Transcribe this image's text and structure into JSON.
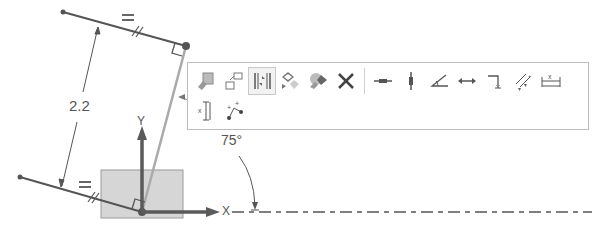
{
  "sketch": {
    "dimension_value": "2.2",
    "angle_value": "75°",
    "axis_x_label": "X",
    "axis_y_label": "Y",
    "equal_constraint_top": "=",
    "equal_constraint_bottom": "=",
    "colors": {
      "line": "#555555",
      "construction_line": "#aaaaaa",
      "fixed_block": "#d6d6d6",
      "axis": "#5a5a5a"
    }
  },
  "toolbar": {
    "row1": [
      {
        "name": "paste-icon",
        "tooltip": "Paste"
      },
      {
        "name": "copy-geometry-icon",
        "tooltip": "Copy"
      },
      {
        "name": "mirror-dimension-icon",
        "tooltip": "Symmetric",
        "active": true
      },
      {
        "name": "convert-reference-icon",
        "tooltip": "Convert"
      },
      {
        "name": "replace-icon",
        "tooltip": "Replace"
      },
      {
        "name": "delete-icon",
        "tooltip": "Delete"
      },
      {
        "name": "horizontal-constraint-icon",
        "tooltip": "Horizontal"
      },
      {
        "name": "vertical-constraint-icon",
        "tooltip": "Vertical"
      },
      {
        "name": "angle-constraint-icon",
        "tooltip": "Angle"
      },
      {
        "name": "length-constraint-icon",
        "tooltip": "Length"
      },
      {
        "name": "perpendicular-constraint-icon",
        "tooltip": "Perpendicular"
      },
      {
        "name": "offset-constraint-icon",
        "tooltip": "Offset"
      },
      {
        "name": "horizontal-dimension-icon",
        "tooltip": "Horizontal Dimension"
      }
    ],
    "row2": [
      {
        "name": "vertical-dimension-icon",
        "tooltip": "Vertical Dimension"
      },
      {
        "name": "point-distance-icon",
        "tooltip": "Point Distance"
      }
    ]
  }
}
